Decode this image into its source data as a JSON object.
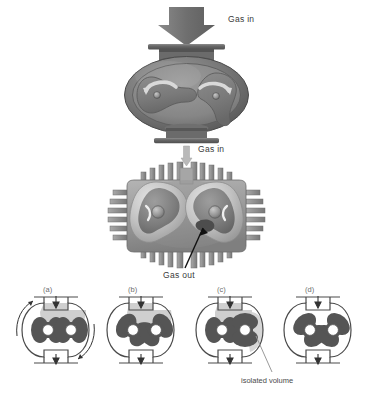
{
  "figure": {
    "background_color": "#ffffff"
  },
  "top_assembly": {
    "inlet_arrow": {
      "name": "thick-gray-down-arrow",
      "color": "#7d7d7d"
    },
    "inlet_label": "Gas in",
    "pump_body": {
      "shell_color": "#6f6f6f",
      "cavity_color": "#8a8a8a",
      "lobe_color": "#7a7a7a",
      "flange_color": "#5c5c5c",
      "rotation_arrow_color": "#d9d9d9"
    }
  },
  "middle_assembly": {
    "inlet_label": "Gas in",
    "inlet_arrow": {
      "name": "thin-gray-down-arrow",
      "color": "#b0b0b0"
    },
    "outlet_label": "Gas out",
    "leader_line_color": "#111111",
    "housing": {
      "fin_color": "#8d8d8d",
      "body_color": "#9a9a9a",
      "rotor_light": "#cfcfcf",
      "rotor_dark": "#6a6a6a",
      "shaft_color": "#8a8a8a"
    }
  },
  "sequence": {
    "note_label": "isolated volume",
    "note_leader_color": "#9a9a9a",
    "outline_color": "#4a4a4a",
    "lobe_color": "#555555",
    "gas_shade_color": "#c9c9c9",
    "hub_color": "#ffffff",
    "panels": [
      {
        "id": "a",
        "label": "(a)",
        "rotation_arrows": true,
        "shaded": true,
        "lobe_orientation_deg": [
          0,
          90
        ],
        "inlet_arrow": "down",
        "outlet_arrow": "down"
      },
      {
        "id": "b",
        "label": "(b)",
        "rotation_arrows": false,
        "shaded": true,
        "lobe_orientation_deg": [
          30,
          120
        ],
        "inlet_arrow": "down",
        "outlet_arrow": "down"
      },
      {
        "id": "c",
        "label": "(c)",
        "rotation_arrows": false,
        "shaded": true,
        "lobe_orientation_deg": [
          0,
          90
        ],
        "inlet_arrow": "down",
        "outlet_arrow": "down"
      },
      {
        "id": "d",
        "label": "(d)",
        "rotation_arrows": false,
        "shaded": false,
        "lobe_orientation_deg": [
          45,
          135
        ],
        "inlet_arrow": "down",
        "outlet_arrow": "down"
      }
    ]
  }
}
